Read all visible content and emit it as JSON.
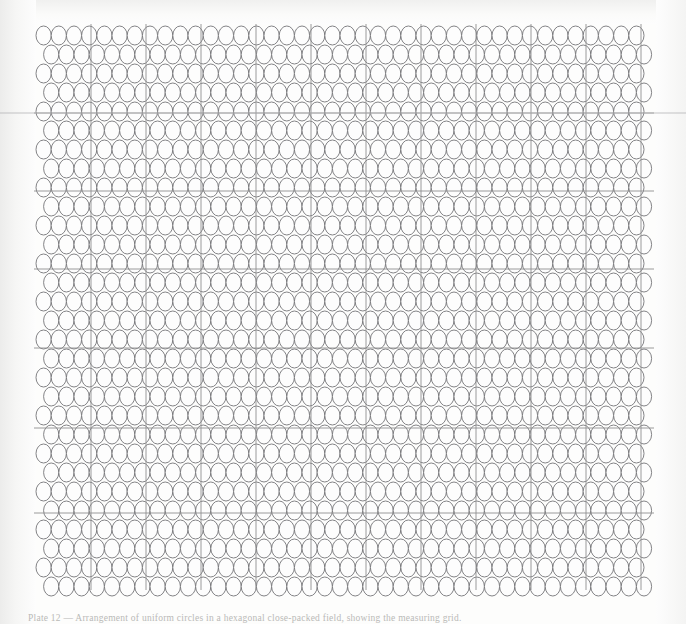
{
  "figure": {
    "type": "scanned-plate",
    "plate": {
      "left": 36,
      "top": 26,
      "width": 616,
      "height": 562
    },
    "circles": {
      "columns": 41,
      "rows": 30,
      "x_pitch": 15.2,
      "y_pitch": 19.0,
      "row_offset_x": 7.6,
      "radius_x": 7.6,
      "radius_y": 9.5,
      "stroke_color": "#6d6d70",
      "stroke_width": 0.85,
      "fill_color": "#fdfdfd",
      "count_label": "1230"
    },
    "grid": {
      "vertical_lines_x": [
        91,
        146,
        201,
        256,
        311,
        366,
        421,
        476,
        531,
        586,
        641
      ],
      "horizontal_lines_y": [
        113,
        191,
        269,
        348,
        428,
        513
      ],
      "line_color": "#8e8e90",
      "line_width": 0.9,
      "minor_line_color": "#c3c3c5",
      "bleed_line_y": 113,
      "bleed_line_color": "#b4b4b6"
    }
  },
  "caption": {
    "text": "Plate 12  —  Arrangement of uniform circles in a hexagonal close-packed field, showing the measuring grid.",
    "visible_note": "clipped at page edge"
  }
}
